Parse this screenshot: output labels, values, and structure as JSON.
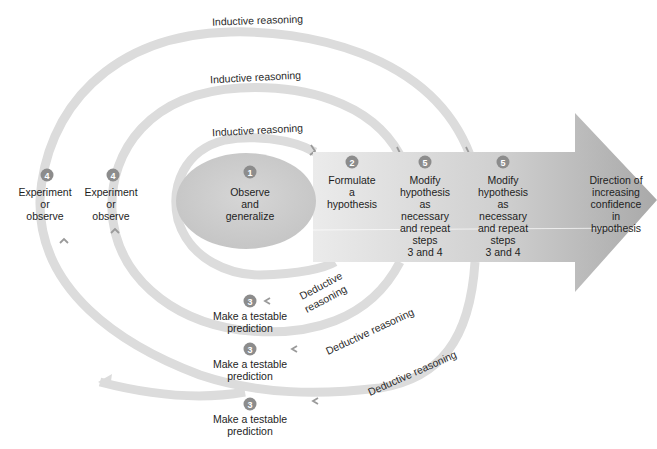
{
  "diagram": {
    "colors": {
      "band": "#dcdcdc",
      "arrow_light": "#e6e6e6",
      "arrow_dark": "#b4b4b4",
      "ellipse": "#cfcfcf",
      "badge": "#8c8c8c",
      "text": "#1e1e1e"
    },
    "inductive_labels": [
      "Inductive reasoning",
      "Inductive reasoning",
      "Inductive reasoning"
    ],
    "deductive_labels": [
      "Deductive",
      "reasoning",
      "Deductive reasoning",
      "Deductive reasoning"
    ],
    "steps": {
      "observe": {
        "number": "1",
        "lines": [
          "Observe",
          "and",
          "generalize"
        ]
      },
      "formulate": {
        "number": "2",
        "lines": [
          "Formulate",
          "a",
          "hypothesis"
        ]
      },
      "predict": [
        {
          "number": "3",
          "lines": [
            "Make a testable",
            "prediction"
          ]
        },
        {
          "number": "3",
          "lines": [
            "Make a testable",
            "prediction"
          ]
        },
        {
          "number": "3",
          "lines": [
            "Make a testable",
            "prediction"
          ]
        }
      ],
      "experiment": [
        {
          "number": "4",
          "lines": [
            "Experiment",
            "or",
            "observe"
          ]
        },
        {
          "number": "4",
          "lines": [
            "Experiment",
            "or",
            "observe"
          ]
        }
      ],
      "modify": [
        {
          "number": "5",
          "lines": [
            "Modify",
            "hypothesis",
            "as",
            "necessary",
            "and repeat",
            "steps",
            "3 and 4"
          ]
        },
        {
          "number": "5",
          "lines": [
            "Modify",
            "hypothesis",
            "as",
            "necessary",
            "and repeat",
            "steps",
            "3 and 4"
          ]
        }
      ]
    },
    "direction_label": [
      "Direction of",
      "increasing",
      "confidence",
      "in",
      "hypothesis"
    ]
  }
}
